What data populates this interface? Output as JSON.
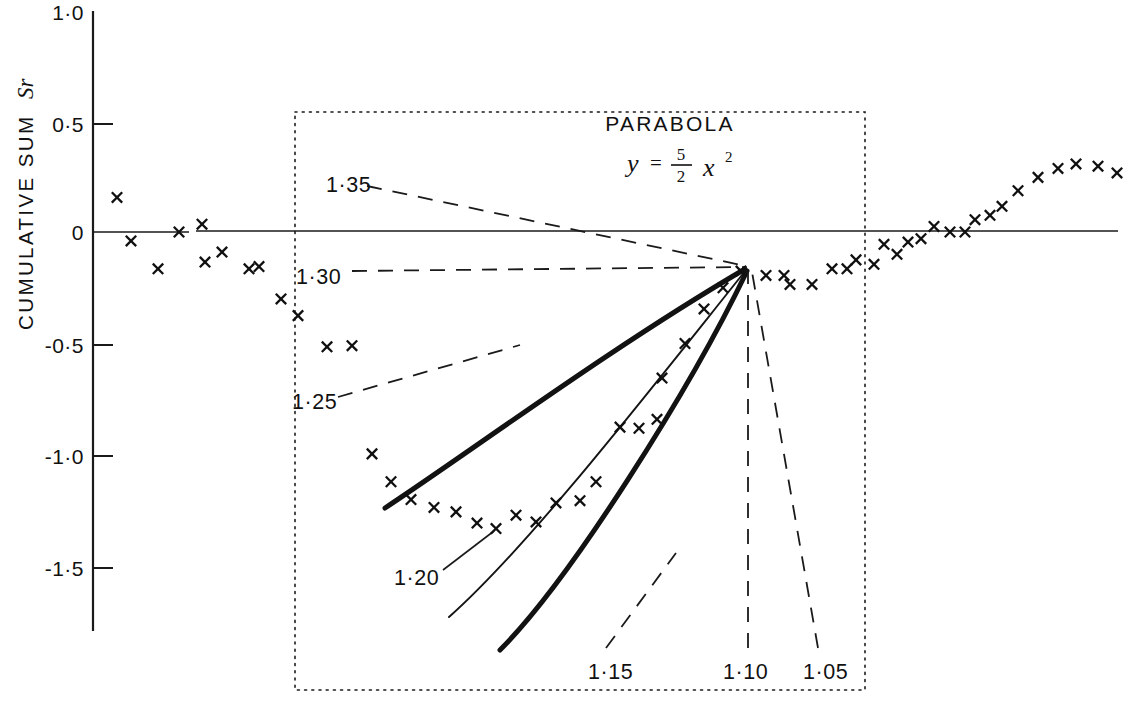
{
  "chart_data": {
    "type": "scatter",
    "title": "PARABOLA",
    "equation_text": "y = 5/2 x^2",
    "equation_parts": {
      "lhs": "y",
      "equals": "=",
      "numerator": "5",
      "denominator": "2",
      "variable": "x",
      "exponent": "2"
    },
    "ylabel": "CUMULATIVE SUM",
    "ylabel_symbol": "Sr",
    "xlabel": "",
    "grid": false,
    "legend": "none",
    "ylim": [
      -1.75,
      1.0
    ],
    "ytick_labels": [
      "1·0",
      "0·5",
      "0",
      "-0·5",
      "-1·0",
      "-1·5"
    ],
    "ytick_values": [
      1.0,
      0.5,
      0,
      -0.5,
      -1.0,
      -1.5
    ],
    "xlim": [
      0,
      1143
    ],
    "series": [
      {
        "name": "observed cumulative sum",
        "marker": "x",
        "points": [
          [
            117,
            0.155
          ],
          [
            131,
            -0.04
          ],
          [
            158,
            -0.165
          ],
          [
            179,
            0.0
          ],
          [
            202,
            0.035
          ],
          [
            205,
            -0.135
          ],
          [
            222,
            -0.09
          ],
          [
            249,
            -0.165
          ],
          [
            259,
            -0.155
          ],
          [
            281,
            -0.3
          ],
          [
            298,
            -0.375
          ],
          [
            327,
            -0.515
          ],
          [
            352,
            -0.51
          ],
          [
            372,
            -0.995
          ],
          [
            391,
            -1.12
          ],
          [
            411,
            -1.2
          ],
          [
            434,
            -1.235
          ],
          [
            456,
            -1.255
          ],
          [
            477,
            -1.305
          ],
          [
            496,
            -1.33
          ],
          [
            516,
            -1.27
          ],
          [
            536,
            -1.3
          ],
          [
            556,
            -1.215
          ],
          [
            580,
            -1.205
          ],
          [
            596,
            -1.12
          ],
          [
            620,
            -0.875
          ],
          [
            639,
            -0.88
          ],
          [
            657,
            -0.84
          ],
          [
            662,
            -0.655
          ],
          [
            685,
            -0.5
          ],
          [
            704,
            -0.345
          ],
          [
            723,
            -0.25
          ],
          [
            741,
            -0.175
          ],
          [
            766,
            -0.195
          ],
          [
            784,
            -0.195
          ],
          [
            790,
            -0.235
          ],
          [
            812,
            -0.235
          ],
          [
            832,
            -0.165
          ],
          [
            847,
            -0.165
          ],
          [
            856,
            -0.125
          ],
          [
            874,
            -0.145
          ],
          [
            884,
            -0.055
          ],
          [
            897,
            -0.1
          ],
          [
            908,
            -0.045
          ],
          [
            921,
            -0.03
          ],
          [
            934,
            0.025
          ],
          [
            950,
            0.0
          ],
          [
            965,
            0.0
          ],
          [
            975,
            0.055
          ],
          [
            990,
            0.075
          ],
          [
            1002,
            0.115
          ],
          [
            1018,
            0.185
          ],
          [
            1038,
            0.245
          ],
          [
            1058,
            0.285
          ],
          [
            1076,
            0.305
          ],
          [
            1098,
            0.295
          ],
          [
            1117,
            0.265
          ]
        ]
      }
    ],
    "fan_origin": {
      "x": 748,
      "y_value": -0.175
    },
    "curves": [
      {
        "label": "1·35",
        "style": "dashed-leader",
        "weight": "leader"
      },
      {
        "label": "1·30",
        "style": "dashed-leader",
        "weight": "leader"
      },
      {
        "label": "1·25",
        "style": "thick",
        "weight": "thick"
      },
      {
        "label": "1·20",
        "style": "thin",
        "weight": "thin"
      },
      {
        "label": "1·15",
        "style": "thick",
        "weight": "thick"
      },
      {
        "label": "1·10",
        "style": "dashed-leader",
        "weight": "leader"
      },
      {
        "label": "1·05",
        "style": "dashed-leader",
        "weight": "leader"
      }
    ],
    "annotations": [
      {
        "text": "PARABOLA",
        "x": 670,
        "y": 128
      },
      {
        "text": "1·35",
        "x": 326,
        "y": 185
      },
      {
        "text": "1·30",
        "x": 296,
        "y": 277
      },
      {
        "text": "1·25",
        "x": 294,
        "y": 402
      },
      {
        "text": "1·20",
        "x": 396,
        "y": 578
      },
      {
        "text": "1·15",
        "x": 590,
        "y": 672
      },
      {
        "text": "1·10",
        "x": 726,
        "y": 672
      },
      {
        "text": "1·05",
        "x": 806,
        "y": 672
      }
    ]
  }
}
